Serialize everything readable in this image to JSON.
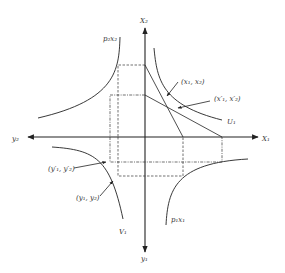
{
  "diagram": {
    "type": "edgeworth-style four-quadrant diagram",
    "axes": {
      "x1": "X₁",
      "x2": "X₂",
      "y1": "y₁",
      "y2": "y₂"
    },
    "curves": {
      "top_left": "p₂x₂",
      "bottom_right": "p₁x₁",
      "indifference_upper": "U₁",
      "indifference_lower": "V₁"
    },
    "points": {
      "x_point": "(x₁, x₂)",
      "x_prime_point": "(x′₁, x′₂)",
      "y_prime_point": "(y′₁, y′₂)",
      "y_point": "(y₁, y₂)"
    },
    "colors": {
      "line": "#222222",
      "background": "#ffffff"
    }
  }
}
